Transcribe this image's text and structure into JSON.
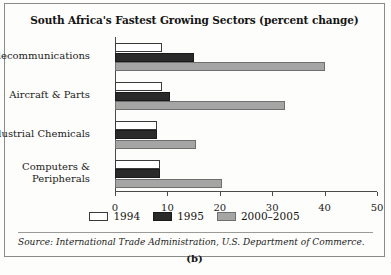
{
  "figure": {
    "panel_label": "(b)",
    "source_note": "Source: International Trade Administration, U.S. Department of Commerce."
  },
  "chart_data": {
    "type": "bar",
    "orientation": "horizontal",
    "title": "South Africa's Fastest Growing Sectors (percent change)",
    "xlabel": "",
    "ylabel": "",
    "xlim": [
      0,
      50
    ],
    "xticks": [
      0,
      10,
      20,
      30,
      40,
      50
    ],
    "xtick_labels": [
      "0",
      "10",
      "20",
      "30",
      "40",
      "50"
    ],
    "grid": false,
    "legend_position": "bottom-center",
    "categories": [
      "Telecommunications",
      "Aircraft & Parts",
      "Industrial Chemicals",
      "Computers &\nPeripherals"
    ],
    "series": [
      {
        "name": "1994",
        "color": "#ffffff",
        "values": [
          9,
          9,
          8,
          8.5
        ]
      },
      {
        "name": "1995",
        "color": "#2a2a2a",
        "values": [
          15,
          10.5,
          8,
          8.5
        ]
      },
      {
        "name": "2000-2005",
        "color": "#a5a5a5",
        "values": [
          40,
          32.5,
          15.5,
          20.5
        ]
      }
    ],
    "legend": [
      "1994",
      "1995",
      "2000–2005"
    ]
  }
}
